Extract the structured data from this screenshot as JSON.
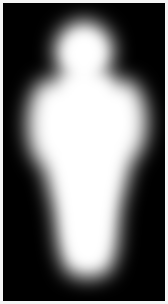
{
  "image": {
    "title": "Blurred human silhouette mask",
    "alt_text": "Soft-edged white human figure silhouette on a black background",
    "width_px": 168,
    "height_px": 304,
    "border_color": "#f4f4f4",
    "border_width_px": 3,
    "background_color": "#000000",
    "foreground_color": "#ffffff",
    "render_style": "gaussian-blurred binary mask",
    "blur_radius_px": 11
  },
  "chart_data": {
    "type": "heatmap",
    "xlabel": "",
    "ylabel": "",
    "colormap": "grayscale",
    "vmin": 0,
    "vmax": 255,
    "background_value": 0,
    "foreground_value": 255,
    "xlim": [
      0,
      160
    ],
    "ylim": [
      0,
      296
    ],
    "grid": false,
    "legend": "none",
    "annotations": [],
    "silhouette_regions": [
      {
        "name": "head",
        "shape": "ellipse",
        "cx": 80,
        "cy": 46,
        "rx": 30,
        "ry": 31,
        "value": 255
      },
      {
        "name": "neck",
        "shape": "rect",
        "x": 64,
        "y": 62,
        "width": 32,
        "height": 22,
        "value": 255
      },
      {
        "name": "torso-shoulders",
        "shape": "polygon",
        "points": [
          [
            50,
            74
          ],
          [
            112,
            74
          ],
          [
            128,
            104
          ],
          [
            130,
            150
          ],
          [
            116,
            206
          ],
          [
            110,
            250
          ],
          [
            52,
            250
          ],
          [
            46,
            206
          ],
          [
            38,
            150
          ],
          [
            36,
            104
          ]
        ],
        "value": 255
      },
      {
        "name": "right-shoulder-bulge",
        "shape": "ellipse",
        "cx": 122,
        "cy": 118,
        "rx": 24,
        "ry": 42,
        "value": 255
      },
      {
        "name": "left-shoulder-bulge",
        "shape": "ellipse",
        "cx": 44,
        "cy": 120,
        "rx": 22,
        "ry": 44,
        "value": 255
      },
      {
        "name": "hips-legs",
        "shape": "polygon",
        "points": [
          [
            58,
            190
          ],
          [
            110,
            190
          ],
          [
            108,
            268
          ],
          [
            60,
            268
          ]
        ],
        "value": 255
      },
      {
        "name": "feet-base",
        "shape": "ellipse",
        "cx": 84,
        "cy": 262,
        "rx": 26,
        "ry": 16,
        "value": 255
      }
    ],
    "intensity_profile_rows": [
      {
        "y": 10,
        "left_edge": null,
        "right_edge": null,
        "peak_value": 0
      },
      {
        "y": 24,
        "left_edge": 62,
        "right_edge": 104,
        "peak_value": 110
      },
      {
        "y": 40,
        "left_edge": 52,
        "right_edge": 114,
        "peak_value": 255
      },
      {
        "y": 60,
        "left_edge": 50,
        "right_edge": 116,
        "peak_value": 255
      },
      {
        "y": 80,
        "left_edge": 38,
        "right_edge": 128,
        "peak_value": 255
      },
      {
        "y": 110,
        "left_edge": 26,
        "right_edge": 142,
        "peak_value": 255
      },
      {
        "y": 140,
        "left_edge": 28,
        "right_edge": 138,
        "peak_value": 255
      },
      {
        "y": 170,
        "left_edge": 36,
        "right_edge": 126,
        "peak_value": 255
      },
      {
        "y": 200,
        "left_edge": 46,
        "right_edge": 116,
        "peak_value": 255
      },
      {
        "y": 230,
        "left_edge": 52,
        "right_edge": 112,
        "peak_value": 255
      },
      {
        "y": 260,
        "left_edge": 54,
        "right_edge": 112,
        "peak_value": 255
      },
      {
        "y": 282,
        "left_edge": 62,
        "right_edge": 104,
        "peak_value": 60
      },
      {
        "y": 296,
        "left_edge": null,
        "right_edge": null,
        "peak_value": 0
      }
    ]
  }
}
